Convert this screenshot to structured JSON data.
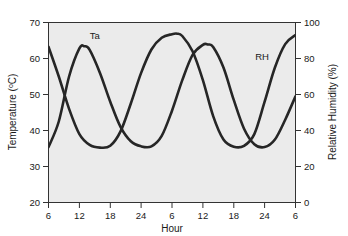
{
  "chart_data": {
    "type": "line",
    "title": "",
    "xlabel": "Hour",
    "ylabel": "Temperature (°C)",
    "y2label": "Relative Humidity (%)",
    "xlim": [
      6,
      54
    ],
    "ylim": [
      20,
      70
    ],
    "y2lim": [
      0,
      100
    ],
    "grid": false,
    "legend_position": "inline-annotations",
    "xticks": [
      6,
      12,
      18,
      24,
      30,
      36,
      42,
      48,
      54
    ],
    "xticklabels": [
      "6",
      "12",
      "18",
      "24",
      "6",
      "12",
      "18",
      "24",
      "6"
    ],
    "yticks": [
      20,
      30,
      40,
      50,
      60,
      70
    ],
    "yticklabels": [
      "20",
      "30",
      "40",
      "50",
      "60",
      "70"
    ],
    "y2ticks": [
      0,
      20,
      40,
      60,
      80,
      100
    ],
    "y2ticklabels": [
      "0",
      "20",
      "40",
      "60",
      "80",
      "100"
    ],
    "annotations": [
      {
        "text": "Ta",
        "x": 15,
        "y": 65.5
      },
      {
        "text": "RH",
        "x": 47.5,
        "y": 59.5
      }
    ],
    "series": [
      {
        "name": "Ta",
        "label": "Ta",
        "axis": "left",
        "units": "°C",
        "x": [
          6,
          8,
          10,
          12,
          13,
          14,
          16,
          18,
          20,
          22,
          24,
          26,
          28,
          30,
          32,
          34,
          36,
          37,
          38,
          40,
          42,
          44,
          46,
          48,
          50,
          52,
          54
        ],
        "y": [
          35.4,
          42.5,
          55.0,
          62.8,
          63.4,
          62.4,
          56.0,
          48.0,
          41.0,
          37.0,
          35.6,
          35.6,
          38.5,
          45.5,
          54.0,
          61.0,
          63.8,
          63.9,
          63.2,
          57.5,
          48.5,
          40.5,
          36.2,
          35.4,
          37.5,
          43.0,
          49.5
        ]
      },
      {
        "name": "RH",
        "label": "RH",
        "axis": "right",
        "units": "%",
        "x": [
          6,
          8,
          10,
          12,
          14,
          16,
          18,
          20,
          22,
          24,
          26,
          28,
          30,
          31,
          32,
          34,
          36,
          38,
          40,
          42,
          44,
          46,
          48,
          50,
          52,
          54
        ],
        "y": [
          86.5,
          70.0,
          52.0,
          38.0,
          32.0,
          30.5,
          31.5,
          39.5,
          55.0,
          72.0,
          85.0,
          91.5,
          93.5,
          93.8,
          92.5,
          84.0,
          68.0,
          48.0,
          35.0,
          31.0,
          31.5,
          38.0,
          56.0,
          75.0,
          88.0,
          93.0
        ]
      }
    ]
  },
  "axes": {
    "x_title": "Hour",
    "y_left_title_prefix": "Temperature (",
    "y_left_title_sup": "o",
    "y_left_title_suffix": "C)",
    "y_right_title": "Relative Humidity (%)"
  },
  "colors": {
    "plot_background": "#ebebeb",
    "page_background": "#ffffff",
    "curve": "#262626",
    "axis": "#333333",
    "text": "#1a1a1a"
  }
}
